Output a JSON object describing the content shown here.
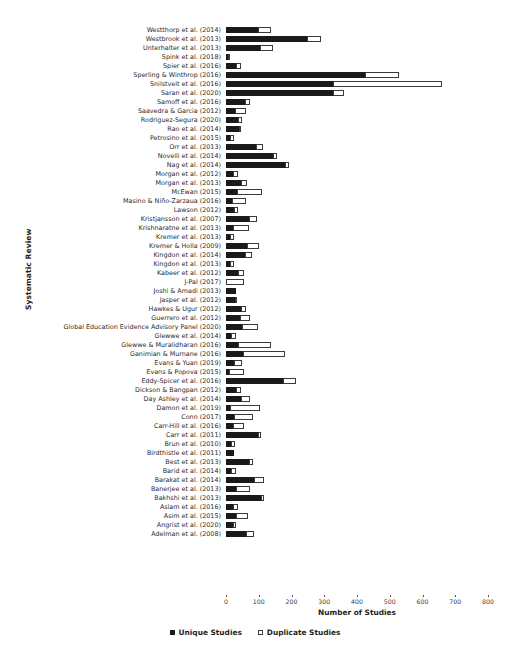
{
  "chart_data": {
    "type": "bar",
    "orientation": "horizontal",
    "stacked": true,
    "title": "",
    "xlabel": "Number of Studies",
    "ylabel": "Systematic Review",
    "xlim": [
      0,
      800
    ],
    "xticks": [
      0,
      100,
      200,
      300,
      400,
      500,
      600,
      700,
      800
    ],
    "grid": false,
    "legend_position": "bottom",
    "legend": [
      "Unique Studies",
      "Duplicate Studies"
    ],
    "series": [
      {
        "name": "Unique Studies",
        "color": "#1a1a1a",
        "style": "filled"
      },
      {
        "name": "Duplicate Studies",
        "color": "#ffffff",
        "style": "open"
      }
    ],
    "categories": [
      "Westthorp et al. (2014)",
      "Westbrook et al. (2013)",
      "Unterhalter et al. (2013)",
      "Spink et al. (2018)",
      "Spier et al. (2016)",
      "Sperling & Winthrop (2016)",
      "Snilstveit et al. (2016)",
      "Saran et al. (2020)",
      "Samoff et al. (2016)",
      "Saavedra & Garcia (2012)",
      "Rodriguez-Segura (2020)",
      "Rao et al. (2014)",
      "Petrosino et al. (2015)",
      "Orr et al. (2013)",
      "Novelli et al. (2014)",
      "Nag et al. (2014)",
      "Morgan et al. (2012)",
      "Morgan et al. (2013)",
      "McEwan (2015)",
      "Masino & Niño-Zarzaua (2016)",
      "Lawson (2012)",
      "Kristjansson et al. (2007)",
      "Krishnaratne et al. (2013)",
      "Kremer et al. (2013)",
      "Kremer & Holla (2009)",
      "Kingdon et al. (2014)",
      "Kingdon et al. (2013)",
      "Kabeer et al. (2012)",
      "J-Pal (2017)",
      "Joshi & Amadi (2013)",
      "Jasper et al. (2012)",
      "Hawkes & Ugur (2012)",
      "Guerrero et al. (2012)",
      "Global Education Evidence Advisory Panel (2020)",
      "Glewwe et al. (2014)",
      "Glewwe & Muralidharan (2016)",
      "Ganimian & Murnane (2016)",
      "Evans & Yuan (2019)",
      "Evans & Popova (2015)",
      "Eddy-Spicer et al. (2016)",
      "Dickson & Bangpan (2012)",
      "Day Ashley et al. (2014)",
      "Damon et al. (2019)",
      "Conn (2017)",
      "Carr-Hill et al. (2016)",
      "Carr et al. (2011)",
      "Brun et al. (2010)",
      "Birdthistle et al. (2011)",
      "Best et al. (2013)",
      "Barid et al. (2014)",
      "Barakat et al. (2014)",
      "Banerjee et al. (2013)",
      "Bakhshi et al. (2013)",
      "Aslam et al. (2016)",
      "Asim et al. (2015)",
      "Angrist et al. (2020)",
      "Adelman et al. (2008)"
    ],
    "unique_studies": [
      100,
      250,
      105,
      8,
      33,
      425,
      327,
      327,
      58,
      28,
      37,
      41,
      14,
      93,
      145,
      182,
      22,
      48,
      35,
      18,
      25,
      70,
      22,
      12,
      66,
      60,
      14,
      38,
      0,
      30,
      28,
      47,
      45,
      50,
      17,
      37,
      53,
      25,
      10,
      175,
      33,
      48,
      12,
      25,
      22,
      98,
      16,
      25,
      70,
      17,
      86,
      33,
      107,
      22,
      33,
      22,
      62
    ],
    "duplicate_studies": [
      40,
      40,
      40,
      4,
      13,
      105,
      335,
      36,
      15,
      34,
      13,
      4,
      13,
      20,
      11,
      13,
      15,
      16,
      75,
      43,
      12,
      26,
      49,
      14,
      36,
      22,
      13,
      19,
      55,
      0,
      6,
      14,
      28,
      50,
      16,
      103,
      127,
      25,
      45,
      40,
      15,
      26,
      93,
      58,
      33,
      9,
      14,
      0,
      15,
      15,
      32,
      42,
      9,
      17,
      34,
      11,
      25
    ]
  }
}
